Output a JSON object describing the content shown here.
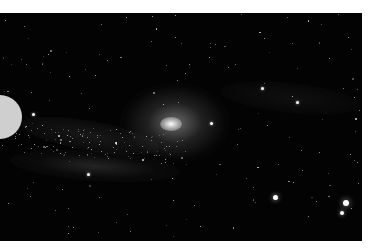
{
  "image": {
    "subject": "spiral galaxy (Andromeda-like) in starfield",
    "background_color": "#030303",
    "border_color": "#ffffff",
    "overlay_disc_color": "#cfcfcf",
    "bright_stars": [
      {
        "x": 275,
        "y": 197,
        "r": 2.5
      },
      {
        "x": 346,
        "y": 203,
        "r": 3
      },
      {
        "x": 342,
        "y": 213,
        "r": 2
      },
      {
        "x": 211,
        "y": 123,
        "r": 1.5
      },
      {
        "x": 297,
        "y": 102,
        "r": 1.5
      },
      {
        "x": 262,
        "y": 88,
        "r": 1.5
      },
      {
        "x": 33,
        "y": 114,
        "r": 1.5
      },
      {
        "x": 88,
        "y": 174,
        "r": 1.5
      }
    ]
  }
}
